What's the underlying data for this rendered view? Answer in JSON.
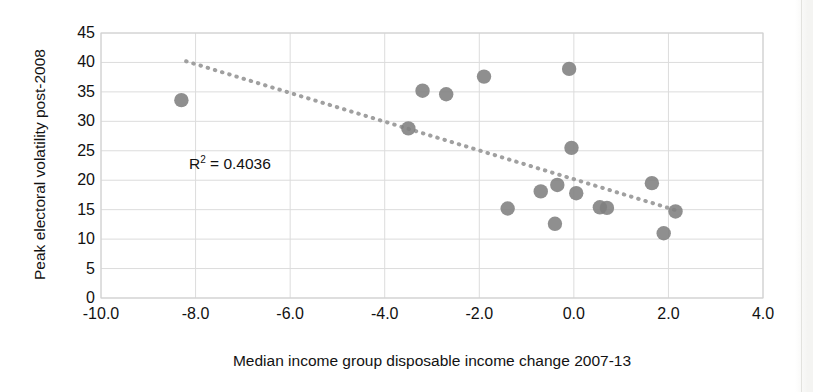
{
  "chart_data": {
    "type": "scatter",
    "title": "",
    "xlabel": "Median income group disposable income change 2007-13",
    "ylabel": "Peak electoral volatility post-2008",
    "xlim": [
      -10.0,
      4.0
    ],
    "ylim": [
      0,
      45
    ],
    "xticks": [
      "-10.0",
      "-8.0",
      "-6.0",
      "-4.0",
      "-2.0",
      "0.0",
      "2.0",
      "4.0"
    ],
    "xtick_values": [
      -10.0,
      -8.0,
      -6.0,
      -4.0,
      -2.0,
      0.0,
      2.0,
      4.0
    ],
    "yticks": [
      "0",
      "5",
      "10",
      "15",
      "20",
      "25",
      "30",
      "35",
      "40",
      "45"
    ],
    "ytick_values": [
      0,
      5,
      10,
      15,
      20,
      25,
      30,
      35,
      40,
      45
    ],
    "grid": true,
    "legend": "none",
    "marker_color": "#808080",
    "trendline_color": "#a0a0a0",
    "annotation": "R² = 0.4036",
    "annotation_r2_value": 0.4036,
    "points": [
      {
        "x": -8.3,
        "y": 33.6
      },
      {
        "x": -3.5,
        "y": 28.8
      },
      {
        "x": -3.2,
        "y": 35.2
      },
      {
        "x": -2.7,
        "y": 34.6
      },
      {
        "x": -1.9,
        "y": 37.6
      },
      {
        "x": -1.4,
        "y": 15.2
      },
      {
        "x": -0.7,
        "y": 18.1
      },
      {
        "x": -0.35,
        "y": 19.2
      },
      {
        "x": -0.4,
        "y": 12.6
      },
      {
        "x": -0.1,
        "y": 38.9
      },
      {
        "x": -0.05,
        "y": 25.5
      },
      {
        "x": 0.05,
        "y": 17.8
      },
      {
        "x": 0.55,
        "y": 15.4
      },
      {
        "x": 0.7,
        "y": 15.3
      },
      {
        "x": 1.65,
        "y": 19.5
      },
      {
        "x": 1.9,
        "y": 11.0
      },
      {
        "x": 2.15,
        "y": 14.7
      }
    ],
    "trendline": {
      "x_start": -8.2,
      "y_start": 40.2,
      "x_end": 2.2,
      "y_end": 14.8,
      "style": "dotted"
    }
  }
}
